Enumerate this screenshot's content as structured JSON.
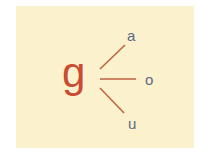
{
  "diagram": {
    "root": "g",
    "branches": [
      {
        "label": "a"
      },
      {
        "label": "o"
      },
      {
        "label": "u"
      }
    ],
    "colors": {
      "background": "#fcf1cd",
      "root": "#c84b32",
      "lines": "#c0603f",
      "leaves": "#5c6a86"
    }
  }
}
